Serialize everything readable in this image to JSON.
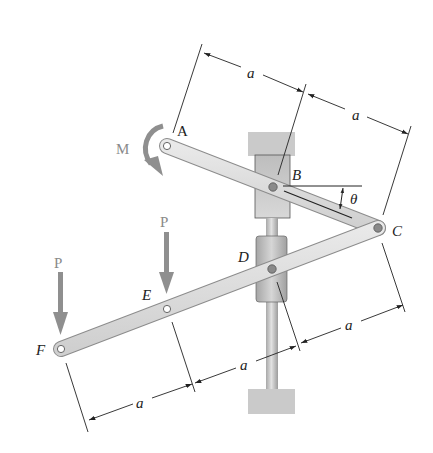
{
  "figure": {
    "type": "mechanism-free-body-setup"
  },
  "labels": {
    "A": "A",
    "B": "B",
    "C": "C",
    "D": "D",
    "E": "E",
    "F": "F",
    "moment": "M",
    "force_E": "P",
    "force_F": "P",
    "angle": "θ"
  },
  "dimensions": {
    "AB": "a",
    "BC": "a",
    "CD": "a",
    "DE": "a",
    "EF": "a"
  },
  "points": {
    "A": [
      167,
      146
    ],
    "B": [
      273,
      187
    ],
    "C": [
      378,
      228
    ],
    "D": [
      272,
      269
    ],
    "E": [
      167,
      309
    ],
    "F": [
      61,
      349
    ]
  },
  "colors": {
    "link_fill": "#dcdcdc",
    "link_stroke": "#9a9a9a",
    "load_arrow": "#8f8f8f",
    "support_fill": "#c8c8c8",
    "guide_fill": "#d4d4d4",
    "rod_fill": "#bdbdbd",
    "dimension_line": "#222222",
    "text": "#222222",
    "load_text": "#888888"
  }
}
